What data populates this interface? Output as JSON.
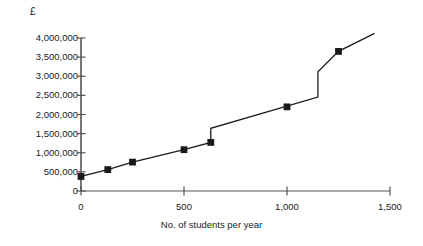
{
  "chart_data": {
    "type": "line",
    "title": "",
    "subtitle": "",
    "xlabel": "No. of students per year",
    "ylabel": "£",
    "ylabel_unit": "£",
    "xlim": [
      0,
      1500
    ],
    "ylim": [
      0,
      4000000
    ],
    "grid": false,
    "legend": "none",
    "x_ticks": [
      0,
      500,
      1000,
      1500
    ],
    "x_tick_labels": [
      "0",
      "500",
      "1,000",
      "1,500"
    ],
    "y_ticks": [
      0,
      500000,
      1000000,
      1500000,
      2000000,
      2500000,
      3000000,
      3500000,
      4000000
    ],
    "y_tick_labels": [
      "0",
      "500,000",
      "1,000,000",
      "1,500,000",
      "2,000,000",
      "2,500,000",
      "3,000,000",
      "3,500,000",
      "4,000,000"
    ],
    "line_color": "#1a1a1a",
    "marker_color": "#1a1a1a",
    "marker_style": "square",
    "series": [
      {
        "name": "Total cost",
        "markers": [
          {
            "x": 0,
            "y": 380000
          },
          {
            "x": 130,
            "y": 560000
          },
          {
            "x": 250,
            "y": 755000
          },
          {
            "x": 500,
            "y": 1080000
          },
          {
            "x": 630,
            "y": 1270000
          },
          {
            "x": 1000,
            "y": 2200000
          },
          {
            "x": 1250,
            "y": 3650000
          }
        ],
        "path": [
          {
            "x": 0,
            "y": 380000
          },
          {
            "x": 130,
            "y": 560000
          },
          {
            "x": 250,
            "y": 755000
          },
          {
            "x": 500,
            "y": 1080000
          },
          {
            "x": 630,
            "y": 1270000
          },
          {
            "x": 630,
            "y": 1640000
          },
          {
            "x": 1150,
            "y": 2455000
          },
          {
            "x": 1150,
            "y": 3115000
          },
          {
            "x": 1250,
            "y": 3650000
          },
          {
            "x": 1425,
            "y": 4120000
          }
        ],
        "steps": [
          {
            "x": 630,
            "from": 1270000,
            "to": 1640000
          },
          {
            "x": 1150,
            "from": 2455000,
            "to": 3115000
          }
        ]
      }
    ]
  }
}
